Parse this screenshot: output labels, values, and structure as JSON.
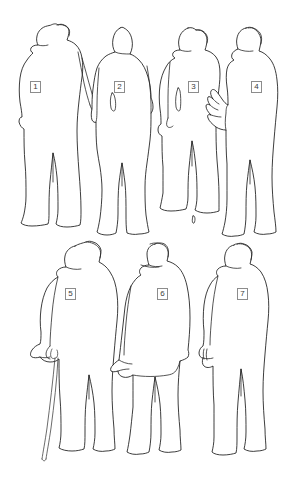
{
  "diagram": {
    "type": "figure-identification-key",
    "background_color": "#ffffff",
    "outline_color": "#1a1a1a",
    "label_border_color": "#8c8c8c",
    "label_text_color": "#3b3b3b",
    "width": 292,
    "height": 482,
    "rows": [
      {
        "row_label": "top-row",
        "figure_numbers": [
          "1",
          "2",
          "3",
          "4"
        ]
      },
      {
        "row_label": "bottom-row",
        "figure_numbers": [
          "5",
          "6",
          "7"
        ]
      }
    ],
    "figures": [
      {
        "number": "1",
        "description": "man in long overcoat and flat cap, right arm extended downward",
        "headwear": "flat cap",
        "label_x": 30,
        "label_y": 81,
        "row": "top-row"
      },
      {
        "number": "2",
        "description": "bare-headed man standing upright, arms at sides",
        "headwear": "none",
        "label_x": 114,
        "label_y": 81,
        "row": "top-row"
      },
      {
        "number": "3",
        "description": "man in long coat with peaked cap, arm bent at side",
        "headwear": "peaked cap",
        "label_x": 188,
        "label_y": 81,
        "row": "top-row"
      },
      {
        "number": "4",
        "description": "man in long coat with cap, left hand raised with fingers showing",
        "headwear": "cap",
        "label_x": 251,
        "label_y": 81,
        "row": "top-row"
      },
      {
        "number": "5",
        "description": "man in cap holding a walking stick in left hand",
        "headwear": "flat cap",
        "label_x": 65,
        "label_y": 288,
        "row": "bottom-row"
      },
      {
        "number": "6",
        "description": "man in bowler hat and long coat, left arm extended forward",
        "headwear": "bowler hat",
        "label_x": 157,
        "label_y": 288,
        "row": "bottom-row"
      },
      {
        "number": "7",
        "description": "man in peaked cap and jacket, standing in three-quarter view",
        "headwear": "peaked cap",
        "label_x": 237,
        "label_y": 288,
        "row": "bottom-row"
      }
    ]
  }
}
